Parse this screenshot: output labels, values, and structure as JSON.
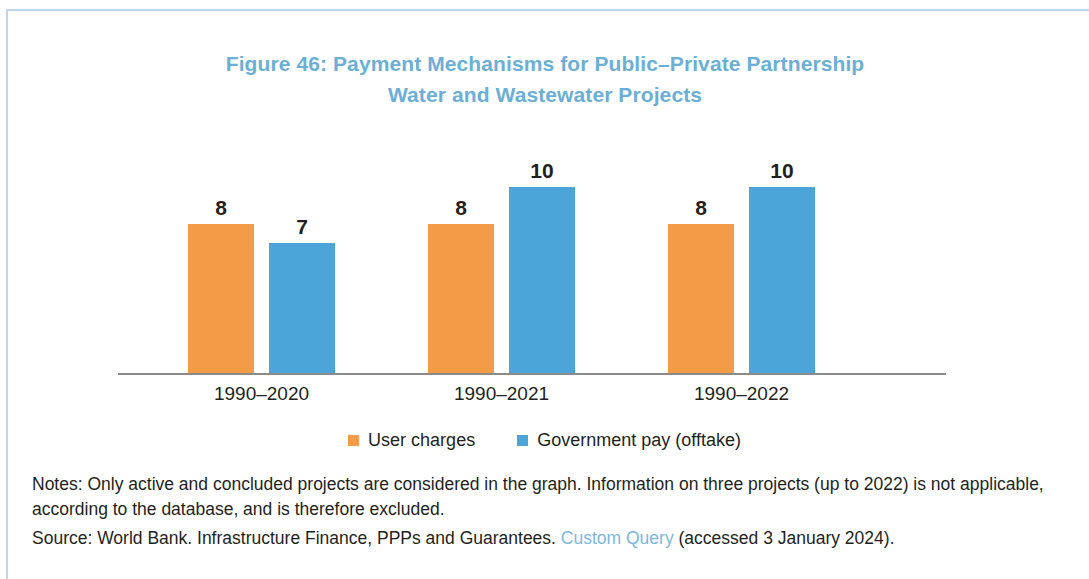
{
  "figure": {
    "title_line1": "Figure 46: Payment Mechanisms for Public–Private Partnership",
    "title_line2": "Water and Wastewater Projects",
    "title_color": "#6bafd6",
    "frame_color": "#bcd8ea"
  },
  "chart_data": {
    "type": "bar",
    "title": "Figure 46: Payment Mechanisms for Public–Private Partnership Water and Wastewater Projects",
    "xlabel": "",
    "ylabel": "",
    "ylim": [
      0,
      12.5
    ],
    "grid": false,
    "axis_line": true,
    "legend_position": "bottom-center",
    "data_labels": true,
    "categories": [
      "1990–2020",
      "1990–2021",
      "1990–2022"
    ],
    "series": [
      {
        "name": "User charges",
        "color": "#f49b47",
        "values": [
          8,
          8,
          8
        ]
      },
      {
        "name": "Government pay (offtake)",
        "color": "#4ba5d8",
        "values": [
          7,
          10,
          10
        ]
      }
    ]
  },
  "legend": {
    "items": [
      {
        "label": "User charges",
        "color": "#f49b47"
      },
      {
        "label": "Government pay (offtake)",
        "color": "#4ba5d8"
      }
    ]
  },
  "footnotes": {
    "notes_line1": "Notes: Only active and concluded projects are considered in the graph. Information on three projects (up to 2022)",
    "notes_line2": "is not applicable, according to the database, and is therefore excluded.",
    "source_prefix": "Source: World Bank. Infrastructure Finance, PPPs and Guarantees.",
    "source_link": "Custom Query",
    "source_suffix": "(accessed 3 January 2024)."
  }
}
